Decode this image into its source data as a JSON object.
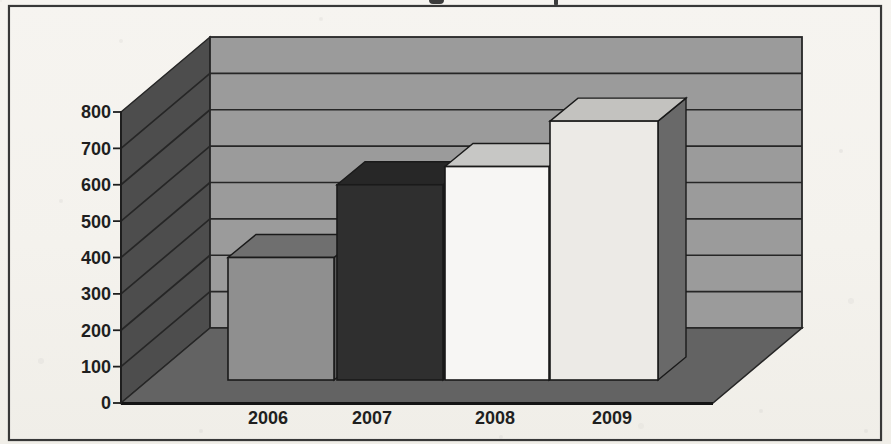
{
  "page": {
    "kind": "scanned textbook figure",
    "paper_color": "#f4f2ed",
    "frame_border_color": "#383838"
  },
  "cropped_text_fragments": {
    "note": "descender fragments of a text line cut off at the top edge",
    "marks": [
      "g-descender",
      "p-descender"
    ]
  },
  "chart_data": {
    "type": "bar",
    "projection": "3d-column",
    "title": "",
    "xlabel": "",
    "ylabel": "",
    "categories": [
      "2006",
      "2007",
      "2008",
      "2009"
    ],
    "values": [
      400,
      600,
      650,
      775
    ],
    "ylim": [
      0,
      800
    ],
    "ytick_step": 100,
    "yticks": [
      "0",
      "100",
      "200",
      "300",
      "400",
      "500",
      "600",
      "700",
      "800"
    ],
    "grid": true,
    "legend": false,
    "style": {
      "bar_front": [
        "#8f8f8f",
        "#2f2f2f",
        "#f7f6f4",
        "#eceae6"
      ],
      "bar_top": [
        "#6f6f6f",
        "#272727",
        "#c7c7c5",
        "#c3c2bf"
      ],
      "bar_side": [
        "#5a5a5a",
        "#1d1d1d",
        "#8a8a8a",
        "#696969"
      ],
      "back_wall": "#9b9b9b",
      "left_wall": "#4d4d4d",
      "floor": "#636363",
      "outline": "#1a1a1a",
      "gridline": "#262626",
      "label_color": "#1f1f1f"
    }
  }
}
